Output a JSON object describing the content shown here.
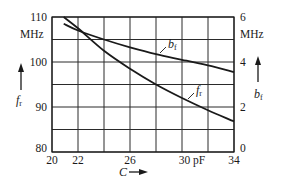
{
  "chart_data": {
    "type": "line",
    "title": "",
    "xlabel": "C",
    "x_unit": "pF",
    "ylabel_left": "f_r",
    "ylabel_left_unit": "MHz",
    "ylabel_right": "b_f",
    "ylabel_right_unit": "MHz",
    "xlim": [
      20,
      34
    ],
    "ylim_left": [
      80,
      110
    ],
    "ylim_right": [
      0,
      6
    ],
    "x_ticks": [
      "20",
      "22",
      "26",
      "30 pF",
      "34"
    ],
    "x_tick_values": [
      20,
      22,
      26,
      30,
      34
    ],
    "x_grid": [
      20,
      22,
      24,
      26,
      28,
      30,
      32,
      34
    ],
    "y_left_ticks": [
      "80",
      "90",
      "100",
      "110"
    ],
    "y_left_tick_values": [
      80,
      90,
      100,
      110
    ],
    "y_right_ticks": [
      "0",
      "2",
      "4",
      "6"
    ],
    "y_right_tick_values": [
      0,
      2,
      4,
      6
    ],
    "y_grid_left": [
      80,
      85,
      90,
      95,
      100,
      105,
      110
    ],
    "grid": true,
    "legend": "inline curve labels",
    "series": [
      {
        "name": "f_r",
        "axis": "left",
        "x": [
          20.9,
          22,
          24,
          26,
          28,
          30,
          32,
          34
        ],
        "values": [
          110,
          107.5,
          102.5,
          98.5,
          95,
          92,
          89.3,
          86.8
        ],
        "label_position": {
          "x": 30.5,
          "y_axis_value": 93.5
        }
      },
      {
        "name": "b_f",
        "axis": "right",
        "x": [
          20.9,
          22,
          24,
          26,
          28,
          30,
          32,
          34
        ],
        "values": [
          5.7,
          5.4,
          5.0,
          4.65,
          4.35,
          4.1,
          3.85,
          3.55
        ],
        "label_position": {
          "x": 27.0,
          "y_axis_value": 4.6
        }
      }
    ]
  },
  "labels": {
    "left_unit": "MHz",
    "right_unit": "MHz",
    "left_symbol_main": "f",
    "left_symbol_sub": "r",
    "right_symbol_main": "b",
    "right_symbol_sub": "f",
    "x_symbol": "C",
    "fr_curve_main": "f",
    "fr_curve_sub": "r",
    "bf_curve_main": "b",
    "bf_curve_sub": "f"
  },
  "style": {
    "line_color": "#1a1a1a",
    "grid_color": "#2a2a2a",
    "background": "#ffffff"
  }
}
